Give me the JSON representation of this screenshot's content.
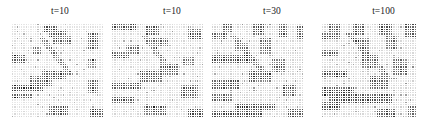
{
  "figure": {
    "background_color": "#ffffff",
    "width": 428,
    "height": 125,
    "panel_count": 4,
    "grid_line_color": "#ffffff",
    "cmap": "greyscale",
    "cmap_low_color": "#ffffff",
    "cmap_high_color": "#1c1c1c"
  },
  "panels": [
    {
      "title": "t=10",
      "title_align": "center",
      "rows": 40,
      "cols": 40,
      "plot_left": 12,
      "plot_top": 24,
      "plot_width": 92,
      "plot_height": 94
    },
    {
      "title": "t=10",
      "title_align": "center-right",
      "rows": 40,
      "cols": 40,
      "plot_left": 112,
      "plot_top": 24,
      "plot_width": 92,
      "plot_height": 94
    },
    {
      "title": "t=30",
      "title_align": "center-right",
      "rows": 40,
      "cols": 40,
      "plot_left": 212,
      "plot_top": 24,
      "plot_width": 92,
      "plot_height": 94
    },
    {
      "title": "t=100",
      "title_align": "center-right",
      "rows": 40,
      "cols": 40,
      "plot_left": 322,
      "plot_top": 24,
      "plot_width": 95,
      "plot_height": 94
    }
  ],
  "chart_data": {
    "type": "heatmap",
    "title": "",
    "subtitle": "",
    "xlabel": "",
    "ylabel": "",
    "grid": true,
    "legend": "none",
    "colorscale": {
      "min_value": 0,
      "max_value": 1,
      "min_color": "#ffffff",
      "max_color": "#1c1c1c"
    },
    "panel_titles": [
      "t=10",
      "t=10",
      "t=30",
      "t=100"
    ],
    "rows": 40,
    "cols": 40,
    "panels": [
      {
        "title": "t=10",
        "matrix_spec": {
          "seed": 17,
          "base": 0.07,
          "noise": 0.1,
          "features": [
            {
              "kind": "block",
              "r0": 1,
              "r1": 4,
              "c0": 14,
              "c1": 20,
              "v": 0.78
            },
            {
              "kind": "block",
              "r0": 3,
              "r1": 6,
              "c0": 16,
              "c1": 24,
              "v": 0.7
            },
            {
              "kind": "block",
              "r0": 5,
              "r1": 9,
              "c0": 18,
              "c1": 26,
              "v": 0.66
            },
            {
              "kind": "block",
              "r0": 4,
              "r1": 11,
              "c0": 33,
              "c1": 38,
              "v": 0.72
            },
            {
              "kind": "block",
              "r0": 10,
              "r1": 13,
              "c0": 9,
              "c1": 13,
              "v": 0.62
            },
            {
              "kind": "block",
              "r0": 13,
              "r1": 17,
              "c0": 0,
              "c1": 6,
              "v": 0.74
            },
            {
              "kind": "block",
              "r0": 15,
              "r1": 19,
              "c0": 33,
              "c1": 37,
              "v": 0.58
            },
            {
              "kind": "block",
              "r0": 20,
              "r1": 24,
              "c0": 13,
              "c1": 24,
              "v": 0.72
            },
            {
              "kind": "block",
              "r0": 22,
              "r1": 27,
              "c0": 8,
              "c1": 18,
              "v": 0.66
            },
            {
              "kind": "block",
              "r0": 24,
              "r1": 30,
              "c0": 33,
              "c1": 38,
              "v": 0.68
            },
            {
              "kind": "hband",
              "r0": 26,
              "r1": 29,
              "c0": 0,
              "c1": 14,
              "v": 0.8
            },
            {
              "kind": "hband",
              "r0": 30,
              "r1": 32,
              "c0": 0,
              "c1": 9,
              "v": 0.76
            },
            {
              "kind": "block",
              "r0": 35,
              "r1": 39,
              "c0": 16,
              "c1": 25,
              "v": 0.74
            },
            {
              "kind": "block",
              "r0": 36,
              "r1": 40,
              "c0": 34,
              "c1": 40,
              "v": 0.76
            },
            {
              "kind": "diag",
              "r0": 6,
              "r1": 22,
              "c0": 12,
              "slope": 0.8,
              "w": 3,
              "v": 0.6
            }
          ]
        }
      },
      {
        "title": "t=10",
        "matrix_spec": {
          "seed": 23,
          "base": 0.08,
          "noise": 0.11,
          "features": [
            {
              "kind": "hband",
              "r0": 0,
              "r1": 3,
              "c0": 0,
              "c1": 11,
              "v": 0.74
            },
            {
              "kind": "block",
              "r0": 1,
              "r1": 5,
              "c0": 15,
              "c1": 21,
              "v": 0.76
            },
            {
              "kind": "block",
              "r0": 2,
              "r1": 7,
              "c0": 33,
              "c1": 39,
              "v": 0.7
            },
            {
              "kind": "block",
              "r0": 6,
              "r1": 10,
              "c0": 17,
              "c1": 25,
              "v": 0.64
            },
            {
              "kind": "block",
              "r0": 9,
              "r1": 13,
              "c0": 6,
              "c1": 12,
              "v": 0.62
            },
            {
              "kind": "hband",
              "r0": 12,
              "r1": 15,
              "c0": 0,
              "c1": 8,
              "v": 0.72
            },
            {
              "kind": "block",
              "r0": 14,
              "r1": 18,
              "c0": 31,
              "c1": 36,
              "v": 0.58
            },
            {
              "kind": "block",
              "r0": 17,
              "r1": 22,
              "c0": 21,
              "c1": 29,
              "v": 0.66
            },
            {
              "kind": "block",
              "r0": 20,
              "r1": 25,
              "c0": 12,
              "c1": 22,
              "v": 0.72
            },
            {
              "kind": "hband",
              "r0": 25,
              "r1": 28,
              "c0": 0,
              "c1": 13,
              "v": 0.78
            },
            {
              "kind": "block",
              "r0": 26,
              "r1": 32,
              "c0": 30,
              "c1": 38,
              "v": 0.68
            },
            {
              "kind": "hband",
              "r0": 31,
              "r1": 34,
              "c0": 0,
              "c1": 10,
              "v": 0.74
            },
            {
              "kind": "block",
              "r0": 35,
              "r1": 39,
              "c0": 14,
              "c1": 24,
              "v": 0.72
            },
            {
              "kind": "block",
              "r0": 36,
              "r1": 40,
              "c0": 33,
              "c1": 40,
              "v": 0.78
            },
            {
              "kind": "diag",
              "r0": 5,
              "r1": 20,
              "c0": 13,
              "slope": 0.75,
              "w": 3,
              "v": 0.58
            }
          ]
        }
      },
      {
        "title": "t=30",
        "matrix_spec": {
          "seed": 31,
          "base": 0.09,
          "noise": 0.12,
          "features": [
            {
              "kind": "block",
              "r0": 0,
              "r1": 4,
              "c0": 5,
              "c1": 9,
              "v": 0.72
            },
            {
              "kind": "block",
              "r0": 0,
              "r1": 5,
              "c0": 18,
              "c1": 23,
              "v": 0.76
            },
            {
              "kind": "block",
              "r0": 0,
              "r1": 6,
              "c0": 29,
              "c1": 33,
              "v": 0.7
            },
            {
              "kind": "block",
              "r0": 1,
              "r1": 7,
              "c0": 37,
              "c1": 40,
              "v": 0.74
            },
            {
              "kind": "hband",
              "r0": 4,
              "r1": 7,
              "c0": 0,
              "c1": 7,
              "v": 0.7
            },
            {
              "kind": "block",
              "r0": 6,
              "r1": 13,
              "c0": 21,
              "c1": 26,
              "v": 0.66
            },
            {
              "kind": "block",
              "r0": 8,
              "r1": 12,
              "c0": 10,
              "c1": 16,
              "v": 0.62
            },
            {
              "kind": "hband",
              "r0": 13,
              "r1": 17,
              "c0": 0,
              "c1": 18,
              "v": 0.78
            },
            {
              "kind": "block",
              "r0": 15,
              "r1": 21,
              "c0": 26,
              "c1": 32,
              "v": 0.64
            },
            {
              "kind": "block",
              "r0": 20,
              "r1": 25,
              "c0": 16,
              "c1": 26,
              "v": 0.7
            },
            {
              "kind": "hband",
              "r0": 24,
              "r1": 28,
              "c0": 0,
              "c1": 12,
              "v": 0.76
            },
            {
              "kind": "block",
              "r0": 26,
              "r1": 31,
              "c0": 31,
              "c1": 37,
              "v": 0.68
            },
            {
              "kind": "hband",
              "r0": 30,
              "r1": 33,
              "c0": 0,
              "c1": 9,
              "v": 0.72
            },
            {
              "kind": "hband",
              "r0": 34,
              "r1": 37,
              "c0": 10,
              "c1": 28,
              "v": 0.76
            },
            {
              "kind": "block",
              "r0": 37,
              "r1": 40,
              "c0": 0,
              "c1": 22,
              "v": 0.8
            },
            {
              "kind": "block",
              "r0": 36,
              "r1": 40,
              "c0": 33,
              "c1": 40,
              "v": 0.74
            },
            {
              "kind": "diag",
              "r0": 5,
              "r1": 22,
              "c0": 8,
              "slope": 0.85,
              "w": 3,
              "v": 0.6
            }
          ]
        }
      },
      {
        "title": "t=100",
        "matrix_spec": {
          "seed": 47,
          "base": 0.09,
          "noise": 0.12,
          "features": [
            {
              "kind": "block",
              "r0": 0,
              "r1": 4,
              "c0": 3,
              "c1": 8,
              "v": 0.7
            },
            {
              "kind": "block",
              "r0": 0,
              "r1": 5,
              "c0": 13,
              "c1": 18,
              "v": 0.74
            },
            {
              "kind": "block",
              "r0": 0,
              "r1": 5,
              "c0": 24,
              "c1": 30,
              "v": 0.72
            },
            {
              "kind": "block",
              "r0": 0,
              "r1": 6,
              "c0": 35,
              "c1": 40,
              "v": 0.76
            },
            {
              "kind": "hband",
              "r0": 4,
              "r1": 7,
              "c0": 0,
              "c1": 8,
              "v": 0.74
            },
            {
              "kind": "block",
              "r0": 6,
              "r1": 12,
              "c0": 15,
              "c1": 20,
              "v": 0.66
            },
            {
              "kind": "block",
              "r0": 5,
              "r1": 11,
              "c0": 27,
              "c1": 32,
              "v": 0.64
            },
            {
              "kind": "hband",
              "r0": 11,
              "r1": 14,
              "c0": 0,
              "c1": 7,
              "v": 0.7
            },
            {
              "kind": "block",
              "r0": 13,
              "r1": 19,
              "c0": 17,
              "c1": 24,
              "v": 0.68
            },
            {
              "kind": "block",
              "r0": 15,
              "r1": 22,
              "c0": 30,
              "c1": 36,
              "v": 0.66
            },
            {
              "kind": "hband",
              "r0": 20,
              "r1": 23,
              "c0": 0,
              "c1": 11,
              "v": 0.74
            },
            {
              "kind": "block",
              "r0": 22,
              "r1": 28,
              "c0": 20,
              "c1": 28,
              "v": 0.7
            },
            {
              "kind": "hband",
              "r0": 27,
              "r1": 31,
              "c0": 0,
              "c1": 14,
              "v": 0.78
            },
            {
              "kind": "hband",
              "r0": 30,
              "r1": 34,
              "c0": 3,
              "c1": 30,
              "v": 0.8
            },
            {
              "kind": "block",
              "r0": 33,
              "r1": 37,
              "c0": 0,
              "c1": 8,
              "v": 0.74
            },
            {
              "kind": "block",
              "r0": 36,
              "r1": 40,
              "c0": 23,
              "c1": 31,
              "v": 0.72
            },
            {
              "kind": "block",
              "r0": 35,
              "r1": 40,
              "c0": 36,
              "c1": 40,
              "v": 0.7
            },
            {
              "kind": "diag",
              "r0": 4,
              "r1": 24,
              "c0": 10,
              "slope": 0.9,
              "w": 3,
              "v": 0.58
            }
          ]
        }
      }
    ]
  }
}
